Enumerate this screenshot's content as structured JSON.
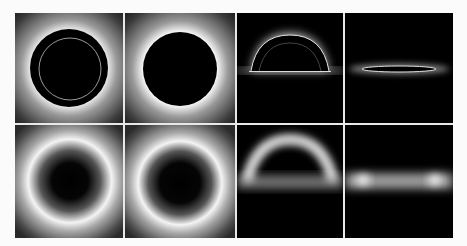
{
  "figure": {
    "layout": {
      "rows": 2,
      "cols": 4,
      "background": "#fbfbfb",
      "divider_color": "#e8e8e8"
    },
    "panels": [
      {
        "id": "r1c1",
        "shape": "disk-with-inner-ring",
        "view": "top",
        "style": "sharp"
      },
      {
        "id": "r1c2",
        "shape": "disk",
        "view": "top",
        "style": "sharp"
      },
      {
        "id": "r1c3",
        "shape": "dome-arc-with-inner-ring",
        "view": "side",
        "style": "sharp"
      },
      {
        "id": "r1c4",
        "shape": "flat-ellipse",
        "view": "side",
        "style": "sharp"
      },
      {
        "id": "r2c1",
        "shape": "glowing-ring",
        "view": "top",
        "style": "blurred"
      },
      {
        "id": "r2c2",
        "shape": "glowing-ring",
        "view": "top",
        "style": "blurred"
      },
      {
        "id": "r2c3",
        "shape": "glowing-arc",
        "view": "side",
        "style": "blurred"
      },
      {
        "id": "r2c4",
        "shape": "glowing-band",
        "view": "side",
        "style": "blurred"
      }
    ]
  }
}
